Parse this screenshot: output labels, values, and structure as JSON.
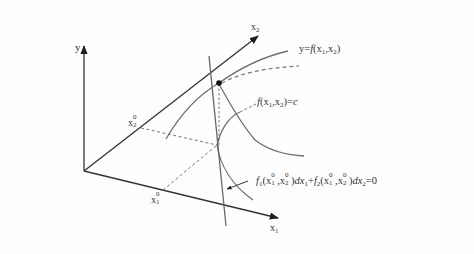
{
  "diagram": {
    "type": "3d-surface-level-curve-tangent",
    "axes": {
      "y": {
        "label": "y"
      },
      "x1": {
        "label": "x",
        "label_sub": "1"
      },
      "x2": {
        "label": "x",
        "label_sub": "2"
      }
    },
    "points": {
      "x1_0": {
        "label": "x",
        "label_sub": "1",
        "label_sup": "0"
      },
      "x2_0": {
        "label": "x",
        "label_sub": "2",
        "label_sup": "0"
      }
    },
    "labels": {
      "surface": "y=f(x₁,x₂)",
      "surface_parts": {
        "lhs": "y=",
        "f": "f",
        "open": "(x",
        "s1": "1",
        "comma": ",x",
        "s2": "2",
        "close": ")"
      },
      "level_curve": "f(x₁,x₂)=c",
      "level_parts": {
        "f": "f",
        "open": "(x",
        "s1": "1",
        "comma": ",x",
        "s2": "2",
        "close": ")=",
        "c": "c"
      },
      "tangent_equation": "f₁(x₁⁰,x₂⁰)dx₁+f₂(x₁⁰,x₂⁰)dx₂=0",
      "tangent_parts": {
        "f1": "f",
        "f1_sub": "1",
        "t1_open": "(x",
        "t1_a_sup": "0",
        "t1_a_sub": "1",
        "t1_comma": ",x",
        "t1_b_sup": "0",
        "t1_b_sub": "2",
        "t1_close": ")",
        "dx1": "dx",
        "dx1_sub": "1",
        "plus": "+",
        "f2": "f",
        "f2_sub": "2",
        "t2_open": "(x",
        "t2_a_sup": "0",
        "t2_a_sub": "1",
        "t2_comma": ",x",
        "t2_b_sup": "0",
        "t2_b_sub": "2",
        "t2_close": ")",
        "dx2": "dx",
        "dx2_sub": "2",
        "eq": "=0"
      }
    },
    "colors": {
      "axis": "#2b2b2b",
      "curve": "#6e6e6e",
      "dashed": "#777777",
      "tangent": "#666666",
      "point": "#111111",
      "text": "#333333"
    }
  }
}
